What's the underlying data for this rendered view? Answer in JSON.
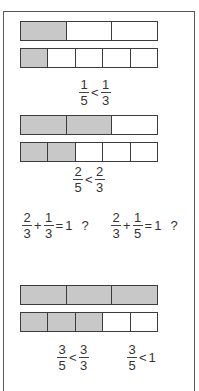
{
  "diagram": {
    "colors": {
      "filled": "#c8c8c8",
      "empty": "#ffffff",
      "border": "#3c3c3c"
    },
    "bars": [
      {
        "id": "bar1",
        "parts": 3,
        "filled": 1,
        "top": 21
      },
      {
        "id": "bar2",
        "parts": 5,
        "filled": 1,
        "top": 48
      },
      {
        "id": "bar3",
        "parts": 3,
        "filled": 2,
        "top": 115
      },
      {
        "id": "bar4",
        "parts": 5,
        "filled": 2,
        "top": 142
      },
      {
        "id": "bar5",
        "parts": 3,
        "filled": 3,
        "top": 285
      },
      {
        "id": "bar6",
        "parts": 5,
        "filled": 3,
        "top": 312
      }
    ],
    "expressions": {
      "e1": {
        "a_num": "1",
        "a_den": "5",
        "op": "<",
        "b_num": "1",
        "b_den": "3"
      },
      "e2": {
        "a_num": "2",
        "a_den": "5",
        "op": "<",
        "b_num": "2",
        "b_den": "3"
      },
      "e3": {
        "a_num": "2",
        "a_den": "3",
        "op1": "+",
        "b_num": "1",
        "b_den": "3",
        "op2": "=",
        "rhs": "1",
        "q": "?"
      },
      "e4": {
        "a_num": "2",
        "a_den": "3",
        "op1": "+",
        "b_num": "1",
        "b_den": "5",
        "op2": "=",
        "rhs": "1",
        "q": "?"
      },
      "e5": {
        "a_num": "3",
        "a_den": "5",
        "op": "<",
        "b_num": "3",
        "b_den": "3"
      },
      "e6": {
        "a_num": "3",
        "a_den": "5",
        "op": "<",
        "rhs": "1"
      }
    }
  }
}
